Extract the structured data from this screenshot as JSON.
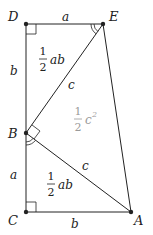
{
  "diagram": {
    "vertices": {
      "D": {
        "label": "D",
        "x": 26,
        "y": 24
      },
      "E": {
        "label": "E",
        "x": 103,
        "y": 24
      },
      "B": {
        "label": "B",
        "x": 26,
        "y": 133
      },
      "C": {
        "label": "C",
        "x": 26,
        "y": 212
      },
      "A": {
        "label": "A",
        "x": 131,
        "y": 212
      }
    },
    "side_labels": {
      "DE": "a",
      "DB": "b",
      "BC": "a",
      "CA": "b",
      "BE": "c",
      "BA": "c"
    },
    "area_labels": {
      "top_triangle": {
        "num": "1",
        "den": "2",
        "expr": "ab"
      },
      "bottom_triangle": {
        "num": "1",
        "den": "2",
        "expr": "ab"
      },
      "middle_triangle": {
        "num": "1",
        "den": "2",
        "expr": "c",
        "exp": "2"
      }
    },
    "colors": {
      "line": "#222222",
      "point": "#222222",
      "middle_label": "#9a9a9a"
    }
  }
}
